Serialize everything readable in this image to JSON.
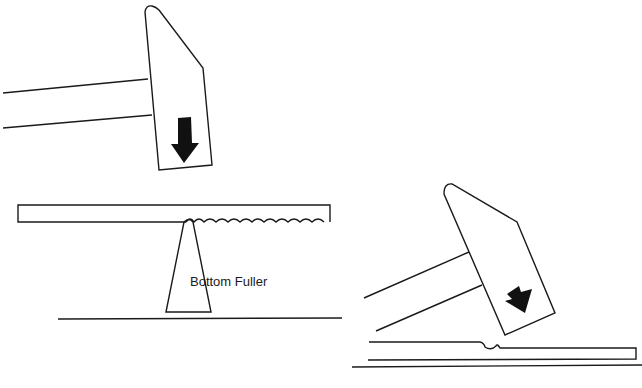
{
  "diagram": {
    "labels": {
      "bottom_fuller": "Bottom Fuller"
    },
    "colors": {
      "line": "#1a1a1a",
      "arrow": "#111111",
      "background": "#ffffff"
    },
    "parts": [
      {
        "id": "hammer-1",
        "kind": "hammer",
        "orientation": "vertical",
        "strike_arrow": "down"
      },
      {
        "id": "stock-1",
        "kind": "bar",
        "fuller_marks": 11
      },
      {
        "id": "bottom-fuller",
        "kind": "tool",
        "label_ref": "bottom_fuller"
      },
      {
        "id": "anvil-line-1",
        "kind": "surface"
      },
      {
        "id": "hammer-2",
        "kind": "hammer",
        "orientation": "tilted",
        "strike_arrow": "down-left-tilt"
      },
      {
        "id": "stock-2",
        "kind": "bar",
        "fuller_marks": 1
      },
      {
        "id": "anvil-line-2",
        "kind": "surface"
      }
    ]
  }
}
